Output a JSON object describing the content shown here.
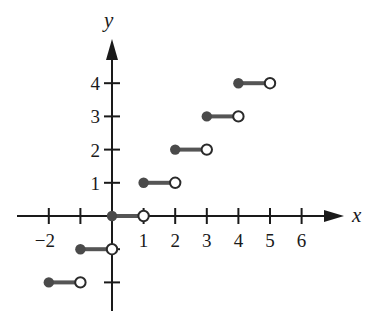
{
  "chart_data": {
    "type": "line",
    "subtype": "step-function (greatest integer / floor function)",
    "title": "",
    "xlabel": "x",
    "ylabel": "y",
    "xlim": [
      -2.5,
      7
    ],
    "ylim": [
      -2.8,
      5.2
    ],
    "grid": false,
    "legend": null,
    "x_ticks": [
      -2,
      -1,
      0,
      1,
      2,
      3,
      4,
      5,
      6
    ],
    "x_tick_labels": [
      "−2",
      "",
      "",
      "1",
      "2",
      "3",
      "4",
      "5",
      "6"
    ],
    "y_ticks": [
      -2,
      -1,
      1,
      2,
      3,
      4
    ],
    "y_tick_labels": [
      "",
      "",
      "1",
      "2",
      "3",
      "4"
    ],
    "segments": [
      {
        "x_start": -2,
        "x_end": -1,
        "y": -2,
        "start": "closed",
        "end": "open"
      },
      {
        "x_start": -1,
        "x_end": 0,
        "y": -1,
        "start": "closed",
        "end": "open"
      },
      {
        "x_start": 0,
        "x_end": 1,
        "y": 0,
        "start": "closed",
        "end": "open"
      },
      {
        "x_start": 1,
        "x_end": 2,
        "y": 1,
        "start": "closed",
        "end": "open"
      },
      {
        "x_start": 2,
        "x_end": 3,
        "y": 2,
        "start": "closed",
        "end": "open"
      },
      {
        "x_start": 3,
        "x_end": 4,
        "y": 3,
        "start": "closed",
        "end": "open"
      },
      {
        "x_start": 4,
        "x_end": 5,
        "y": 4,
        "start": "closed",
        "end": "open"
      }
    ],
    "colors": {
      "axis": "#1a1a1a",
      "segment": "#555555",
      "closed_dot": "#4a4a4a",
      "open_dot_fill": "#ffffff"
    }
  },
  "labels": {
    "x_axis": "x",
    "y_axis": "y",
    "x_ticks": [
      "−2",
      "1",
      "2",
      "3",
      "4",
      "5",
      "6"
    ],
    "y_ticks": [
      "1",
      "2",
      "3",
      "4"
    ]
  }
}
